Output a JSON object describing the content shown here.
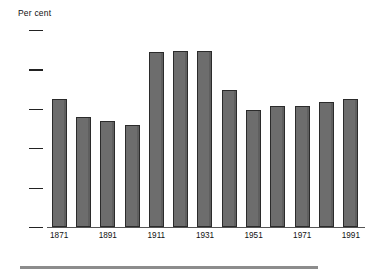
{
  "chart_data": {
    "type": "bar",
    "title": "",
    "subtitle": "",
    "ylabel": "Per cent",
    "xlabel": "",
    "categories": [
      "1871",
      "1881",
      "1891",
      "1901",
      "1911",
      "1921",
      "1931",
      "1941",
      "1951",
      "1961",
      "1971",
      "1981",
      "1991"
    ],
    "values": [
      16.2,
      14.0,
      13.4,
      13.0,
      22.2,
      22.4,
      22.3,
      17.4,
      14.8,
      15.4,
      15.4,
      15.9,
      16.2
    ],
    "ylim": [
      0,
      25
    ],
    "yticks": [
      0,
      5,
      10,
      15,
      20,
      25
    ],
    "ytick_labels": [
      "0",
      "5",
      "10",
      "15",
      "20",
      "25"
    ],
    "xtick_labels": [
      "1871",
      "1891",
      "1911",
      "1931",
      "1951",
      "1971",
      "1991"
    ],
    "xtick_categories": [
      "1871",
      "1891",
      "1911",
      "1931",
      "1951",
      "1971",
      "1991"
    ],
    "grid": false,
    "legend": null,
    "bar_color": "#6d6d6d",
    "bar_edge_color": "#2b2b2b",
    "axis_color": "#555555"
  }
}
